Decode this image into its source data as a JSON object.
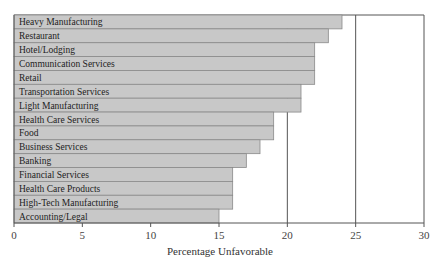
{
  "chart_data": {
    "type": "bar",
    "orientation": "horizontal",
    "title": "",
    "xlabel": "Percentage Unfavorable",
    "ylabel": "",
    "xlim": [
      0,
      30
    ],
    "xticks": [
      0,
      5,
      10,
      15,
      20,
      25,
      30
    ],
    "grid": {
      "vertical_lines_at": [
        20,
        25,
        30
      ]
    },
    "legend": null,
    "bar_color": "#c8c8c8",
    "bar_edge_color": "#8a8a8a",
    "categories": [
      "Heavy Manufacturing",
      "Restaurant",
      "Hotel/Lodging",
      "Communication Services",
      "Retail",
      "Transportation Services",
      "Light Manufacturing",
      "Health Care Services",
      "Food",
      "Business Services",
      "Banking",
      "Financial Services",
      "Health Care Products",
      "High-Tech Manufacturing",
      "Accounting/Legal"
    ],
    "values": [
      24,
      23,
      22,
      22,
      22,
      21,
      21,
      19,
      19,
      18,
      17,
      16,
      16,
      16,
      15
    ]
  }
}
